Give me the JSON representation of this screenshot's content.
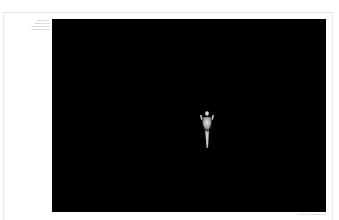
{
  "page": {
    "background": "#ffffff",
    "plate_color": "#000000"
  },
  "caption": {
    "lines": [
      "Untitled (figure)",
      "gelatin silver print",
      "dimensions variable",
      "collection of the artist"
    ]
  },
  "plate": {
    "subject": "standing figure with raised arms, lit against darkness"
  },
  "credit": {
    "text": "Courtesy of the artist and gallery"
  }
}
